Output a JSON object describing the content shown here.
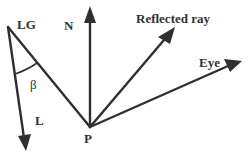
{
  "diagram": {
    "labels": {
      "lg": "LG",
      "n": "N",
      "reflected": "Reflected ray",
      "eye": "Eye",
      "beta": "β",
      "l": "L",
      "p": "P"
    },
    "colors": {
      "stroke": "#2f2f2f",
      "text": "#333333",
      "background": "#ffffff"
    }
  }
}
